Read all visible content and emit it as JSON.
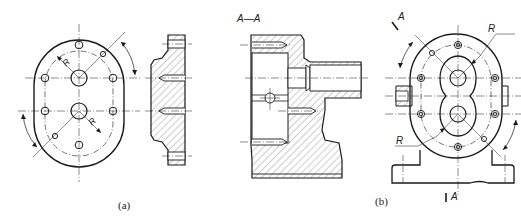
{
  "figure": {
    "top_left_mark": "",
    "section_label": "A—A",
    "view_a": {
      "caption": "(a)",
      "dimension_labels": [
        "R",
        "R"
      ]
    },
    "view_b": {
      "caption": "(b)",
      "cut_plane_label_top": "A",
      "cut_plane_label_bottom": "A",
      "dimension_labels": [
        "R",
        "R"
      ]
    }
  },
  "colors": {
    "line": "#1a1a1a",
    "centerline": "#333333",
    "hatch": "#444444",
    "background": "#ffffff"
  }
}
